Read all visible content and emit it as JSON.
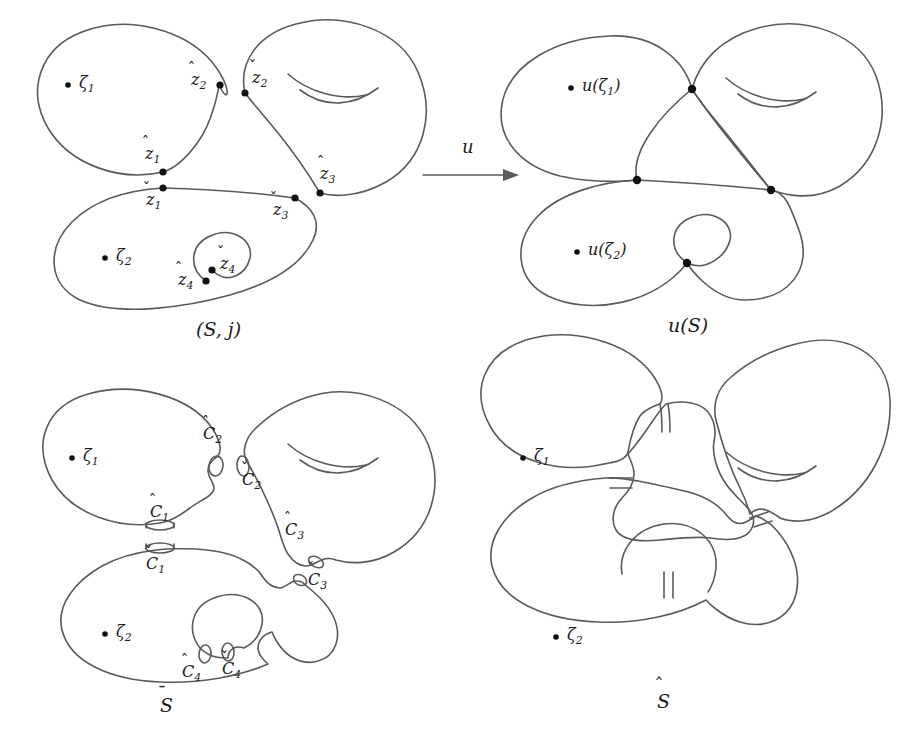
{
  "figure": {
    "type": "mathematical-diagram",
    "background_color": "#ffffff",
    "stroke_color": "#5a5a5a",
    "text_color": "#1a1a1a"
  },
  "panels": [
    {
      "id": "top-left",
      "caption": "(S, j)",
      "caption_parts": {
        "open": "(",
        "s": "S",
        "comma": ",",
        "j": "j",
        "close": ")"
      },
      "marked_points": [
        {
          "name": "zeta-1",
          "label": "ζ",
          "sub": "1",
          "x": 68,
          "y": 85
        },
        {
          "name": "zeta-2",
          "label": "ζ",
          "sub": "2",
          "x": 105,
          "y": 258
        }
      ],
      "nodes": [
        {
          "name": "z1-hat",
          "base": "z",
          "accent": "hat",
          "sub": "1",
          "node_x": 163,
          "node_y": 172
        },
        {
          "name": "z1-check",
          "base": "z",
          "accent": "check",
          "sub": "1",
          "node_x": 163,
          "node_y": 188
        },
        {
          "name": "z2-hat",
          "base": "z",
          "accent": "hat",
          "sub": "2",
          "node_x": 219,
          "node_y": 85
        },
        {
          "name": "z2-check",
          "base": "z",
          "accent": "check",
          "sub": "2",
          "node_x": 245,
          "node_y": 93
        },
        {
          "name": "z3-hat",
          "base": "z",
          "accent": "hat",
          "sub": "3",
          "node_x": 320,
          "node_y": 193
        },
        {
          "name": "z3-check",
          "base": "z",
          "accent": "check",
          "sub": "3",
          "node_x": 295,
          "node_y": 198
        },
        {
          "name": "z4-hat",
          "base": "z",
          "accent": "hat",
          "sub": "4",
          "node_x": 206,
          "node_y": 281
        },
        {
          "name": "z4-check",
          "base": "z",
          "accent": "check",
          "sub": "4",
          "node_x": 212,
          "node_y": 270
        }
      ],
      "components": [
        "left-sphere",
        "right-torus",
        "bottom-sphere-with-loop"
      ]
    },
    {
      "id": "top-right",
      "caption": "u(S)",
      "marked_points": [
        {
          "name": "u-zeta-1",
          "label": "u(ζ",
          "sub": "1",
          "suffix": ")",
          "x": 580,
          "y": 88
        },
        {
          "name": "u-zeta-2",
          "label": "u(ζ",
          "sub": "2",
          "suffix": ")",
          "x": 586,
          "y": 252
        }
      ],
      "nodes": [
        {
          "name": "u-node-upper",
          "node_x": 692,
          "node_y": 89
        },
        {
          "name": "u-node-left",
          "node_x": 637,
          "node_y": 180
        },
        {
          "name": "u-node-right",
          "node_x": 771,
          "node_y": 190
        },
        {
          "name": "u-node-loop",
          "node_x": 687,
          "node_y": 263
        }
      ],
      "components": [
        "left-sphere",
        "right-torus",
        "bottom-sphere-with-loop"
      ]
    },
    {
      "id": "bottom-left",
      "caption": "S",
      "caption_accent": "bar",
      "marked_points": [
        {
          "name": "zeta-1",
          "label": "ζ",
          "sub": "1",
          "x": 72,
          "y": 458
        },
        {
          "name": "zeta-2",
          "label": "ζ",
          "sub": "2",
          "x": 105,
          "y": 634
        }
      ],
      "boundary_circles": [
        {
          "name": "C1-hat",
          "base": "C",
          "accent": "hat",
          "sub": "1",
          "x": 168,
          "y": 532
        },
        {
          "name": "C1-check",
          "base": "C",
          "accent": "check",
          "sub": "1",
          "x": 162,
          "y": 576
        },
        {
          "name": "C2-hat",
          "base": "C",
          "accent": "hat",
          "sub": "2",
          "x": 219,
          "y": 450
        },
        {
          "name": "C2-check",
          "base": "C",
          "accent": "check",
          "sub": "2",
          "x": 253,
          "y": 491
        },
        {
          "name": "C3-hat",
          "base": "C",
          "accent": "hat",
          "sub": "3",
          "x": 298,
          "y": 541
        },
        {
          "name": "C3-check",
          "base": "C",
          "accent": "check",
          "sub": "3",
          "x": 317,
          "y": 589
        },
        {
          "name": "C4-hat",
          "base": "C",
          "accent": "hat",
          "sub": "4",
          "x": 196,
          "y": 673
        },
        {
          "name": "C4-check",
          "base": "C",
          "accent": "check",
          "sub": "4",
          "x": 231,
          "y": 670
        }
      ],
      "components": [
        "left-sphere",
        "right-torus",
        "bottom-sphere-with-loop"
      ]
    },
    {
      "id": "bottom-right",
      "caption": "S",
      "caption_accent": "hat",
      "marked_points": [
        {
          "name": "zeta-1",
          "label": "ζ",
          "sub": "1",
          "x": 530,
          "y": 458
        },
        {
          "name": "zeta-2",
          "label": "ζ",
          "sub": "2",
          "x": 566,
          "y": 637
        }
      ],
      "necks": 4,
      "components": [
        "left-sphere",
        "right-torus",
        "bottom-sphere-with-loop",
        "central-connector"
      ]
    }
  ],
  "arrow": {
    "name": "map-arrow",
    "label": "u",
    "x1": 423,
    "y1": 175,
    "x2": 520,
    "y2": 175,
    "label_x": 462,
    "label_y": 148
  }
}
